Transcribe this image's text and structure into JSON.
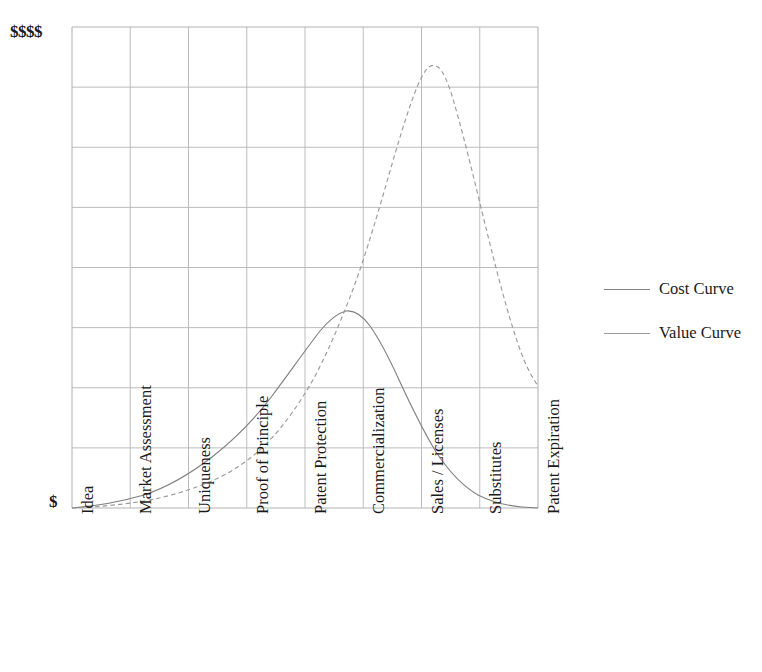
{
  "chart_data": {
    "type": "line",
    "title": "",
    "subtitle": "",
    "xlabel": "",
    "ylabel": "",
    "grid": true,
    "legend_position": "right",
    "categories": [
      "Idea",
      "Market Assessment",
      "Uniqueness",
      "Proof of Principle",
      "Patent Protection",
      "Commercialization",
      "Sales / Licenses",
      "Substitutes",
      "Patent Expiration"
    ],
    "y_axis_ticks": [
      "$",
      "$$$$"
    ],
    "ylim": [
      0,
      8
    ],
    "xlim": [
      0,
      8
    ],
    "series": [
      {
        "name": "Cost Curve",
        "style": "solid",
        "color": "#808080",
        "values": [
          0.0,
          0.45,
          1.05,
          1.95,
          2.95,
          3.3,
          2.0,
          0.7,
          0.15
        ]
      },
      {
        "name": "Value Curve",
        "style": "dashed",
        "color": "#9a9a9a",
        "values": [
          0.0,
          0.3,
          0.75,
          1.55,
          3.3,
          5.7,
          7.4,
          5.0,
          2.05
        ]
      }
    ]
  },
  "legend": {
    "entries": [
      {
        "label": "Cost Curve",
        "style": "solid",
        "color": "#808080"
      },
      {
        "label": "Value Curve",
        "style": "dashed",
        "color": "#9a9a9a"
      }
    ]
  },
  "axis": {
    "y_top_label": "$$$$",
    "y_bottom_label": "$"
  },
  "colors": {
    "grid": "#b4b4b4",
    "axis": "#808080",
    "cost_curve": "#808080",
    "value_curve": "#9a9a9a",
    "text": "#1a1a1a",
    "background": "#ffffff"
  }
}
